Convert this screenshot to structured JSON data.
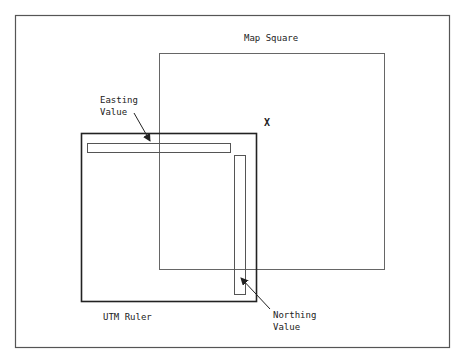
{
  "diagram": {
    "map_square_label": "Map Square",
    "target_mark": "X",
    "utm_ruler_label": "UTM Ruler",
    "easting_label": [
      "Easting",
      "Value"
    ],
    "northing_label": [
      "Northing",
      "Value"
    ]
  },
  "colors": {
    "line": "#555555",
    "ruler_line": "#222222",
    "text": "#222222",
    "background": "#ffffff"
  }
}
